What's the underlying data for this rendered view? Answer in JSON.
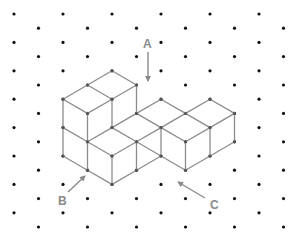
{
  "figure": {
    "grid": {
      "origin_x": 14,
      "origin_y": 14,
      "step_x": 24.5,
      "step_y": 14.2,
      "cols": 12,
      "rows": 16,
      "dot_color": "#111111",
      "dot_radius": 1.6
    },
    "solid": {
      "edge_color": "#8c8c8c",
      "vertex_color": "#555555",
      "edges": [
        [
          [
            4,
            4
          ],
          [
            3,
            5
          ]
        ],
        [
          [
            4,
            4
          ],
          [
            5,
            5
          ]
        ],
        [
          [
            3,
            5
          ],
          [
            2,
            6
          ]
        ],
        [
          [
            3,
            5
          ],
          [
            4,
            6
          ]
        ],
        [
          [
            5,
            5
          ],
          [
            4,
            6
          ]
        ],
        [
          [
            2,
            6
          ],
          [
            3,
            7
          ]
        ],
        [
          [
            4,
            6
          ],
          [
            3,
            7
          ]
        ],
        [
          [
            2,
            6
          ],
          [
            2,
            8
          ]
        ],
        [
          [
            3,
            7
          ],
          [
            3,
            9
          ]
        ],
        [
          [
            4,
            6
          ],
          [
            4,
            8
          ]
        ],
        [
          [
            5,
            5
          ],
          [
            5,
            7
          ]
        ],
        [
          [
            2,
            8
          ],
          [
            3,
            9
          ]
        ],
        [
          [
            2,
            8
          ],
          [
            2,
            10
          ]
        ],
        [
          [
            3,
            9
          ],
          [
            3,
            11
          ]
        ],
        [
          [
            2,
            10
          ],
          [
            3,
            11
          ]
        ],
        [
          [
            3,
            9
          ],
          [
            4,
            8
          ]
        ],
        [
          [
            3,
            9
          ],
          [
            4,
            10
          ]
        ],
        [
          [
            4,
            8
          ],
          [
            5,
            9
          ]
        ],
        [
          [
            4,
            10
          ],
          [
            5,
            9
          ]
        ],
        [
          [
            4,
            10
          ],
          [
            4,
            12
          ]
        ],
        [
          [
            5,
            9
          ],
          [
            5,
            11
          ]
        ],
        [
          [
            3,
            11
          ],
          [
            4,
            12
          ]
        ],
        [
          [
            4,
            12
          ],
          [
            5,
            11
          ]
        ],
        [
          [
            5,
            7
          ],
          [
            4,
            8
          ]
        ],
        [
          [
            5,
            7
          ],
          [
            6,
            8
          ]
        ],
        [
          [
            6,
            8
          ],
          [
            5,
            9
          ]
        ],
        [
          [
            5,
            7
          ],
          [
            6,
            6
          ]
        ],
        [
          [
            6,
            6
          ],
          [
            7,
            7
          ]
        ],
        [
          [
            7,
            7
          ],
          [
            6,
            8
          ]
        ],
        [
          [
            6,
            8
          ],
          [
            6,
            10
          ]
        ],
        [
          [
            5,
            9
          ],
          [
            6,
            10
          ]
        ],
        [
          [
            5,
            11
          ],
          [
            6,
            10
          ]
        ],
        [
          [
            7,
            7
          ],
          [
            8,
            6
          ]
        ],
        [
          [
            8,
            6
          ],
          [
            9,
            7
          ]
        ],
        [
          [
            9,
            7
          ],
          [
            8,
            8
          ]
        ],
        [
          [
            7,
            7
          ],
          [
            8,
            8
          ]
        ],
        [
          [
            6,
            8
          ],
          [
            7,
            9
          ]
        ],
        [
          [
            8,
            8
          ],
          [
            7,
            9
          ]
        ],
        [
          [
            7,
            9
          ],
          [
            7,
            11
          ]
        ],
        [
          [
            6,
            10
          ],
          [
            7,
            11
          ]
        ],
        [
          [
            7,
            11
          ],
          [
            8,
            10
          ]
        ],
        [
          [
            8,
            8
          ],
          [
            8,
            10
          ]
        ],
        [
          [
            9,
            7
          ],
          [
            9,
            9
          ]
        ],
        [
          [
            9,
            9
          ],
          [
            8,
            10
          ]
        ]
      ]
    },
    "labels": [
      {
        "id": "A",
        "text": "A",
        "x": 143,
        "y": 38
      },
      {
        "id": "B",
        "text": "B",
        "x": 58,
        "y": 195
      },
      {
        "id": "C",
        "text": "C",
        "x": 210,
        "y": 199
      }
    ],
    "arrows": [
      {
        "for": "A",
        "x1": 148,
        "y1": 52,
        "x2": 148,
        "y2": 81
      },
      {
        "for": "B",
        "x1": 68,
        "y1": 192,
        "x2": 85,
        "y2": 176
      },
      {
        "for": "C",
        "x1": 205,
        "y1": 198,
        "x2": 178,
        "y2": 182
      }
    ],
    "annotation_color": "#8a8a8a"
  }
}
